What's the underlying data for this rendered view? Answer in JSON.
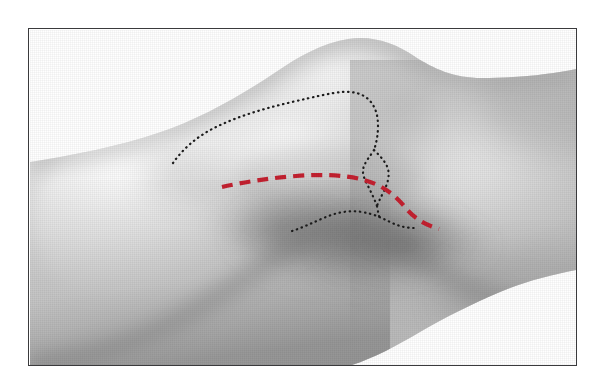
{
  "figure": {
    "kind": "anatomical-photograph",
    "alt_text": "Grayscale photograph of a knee in lateral view with surgical skin markings",
    "frame": {
      "border_color": "#3a3a3c",
      "background_color": "#ffffff",
      "x": 28,
      "y": 28,
      "width": 549,
      "height": 338
    },
    "canvas": {
      "width": 603,
      "height": 386
    }
  },
  "photo": {
    "name": "knee-lateral-photograph",
    "tone_light": "#efefef",
    "tone_mid": "#c9c9c9",
    "tone_dark": "#9a9a9a",
    "tone_shadow": "#6d6d6d",
    "background": "#ffffff",
    "halftone": true
  },
  "markings": {
    "incision_line": {
      "name": "red-dashed-incision-line",
      "color": "#C42130",
      "style": "dashed",
      "stroke_width": 4.2,
      "dash_pattern": "11 7",
      "start": {
        "x": 192,
        "y": 157
      },
      "end": {
        "x": 409,
        "y": 199
      },
      "description": "planned anterolateral skin incision"
    },
    "landmark_outline_upper": {
      "name": "black-dotted-patella-outline",
      "color": "#1c1c1c",
      "style": "dotted",
      "stroke_width": 2.2,
      "dash_pattern": "0.5 4.6",
      "description": "patella and femoral condyle margin"
    },
    "landmark_outline_loop": {
      "name": "black-dotted-tendon-loop",
      "color": "#1c1c1c",
      "style": "dotted",
      "stroke_width": 2.2,
      "dash_pattern": "0.5 4.6",
      "description": "patellar tendon / joint line loop"
    },
    "landmark_outline_lower": {
      "name": "black-dotted-tibial-plateau-line",
      "color": "#1c1c1c",
      "style": "dotted",
      "stroke_width": 2.2,
      "dash_pattern": "0.5 4.6",
      "description": "tibial plateau / joint line"
    }
  },
  "geometry": {
    "leg_silhouette_path": "M 0,132 L 0,132 C 40,126 90,116 128,103 C 170,89 210,66 246,42 C 268,27 292,13 318,9 C 344,5 366,14 384,26 C 404,39 424,48 452,48 C 490,48 522,44 546,39 L 546,39 L 546,240 C 520,245 494,252 470,262 C 442,274 414,288 390,302 C 366,316 344,328 322,335 L 322,335 L 0,335 Z",
    "upper_edge_path": "M 0,132 C 40,126 90,116 128,103 C 170,89 210,66 246,42 C 268,27 292,13 318,9 C 344,5 366,14 384,26 C 404,39 424,48 452,48 C 490,48 522,44 546,39",
    "lower_edge_path": "M 0,335 C 40,330 90,318 128,300 C 176,277 214,250 248,226 C 274,207 296,196 316,196 C 336,196 356,206 378,222 C 410,246 452,266 496,280 C 518,287 534,290 546,292",
    "popliteal_path": "M 246,200 C 276,198 300,204 322,218 C 352,238 392,258 436,272 C 472,283 516,292 546,296",
    "shadow_band_path": "M 120,150 C 170,145 215,160 252,186 C 292,214 336,238 384,252 C 430,265 494,274 546,278"
  }
}
